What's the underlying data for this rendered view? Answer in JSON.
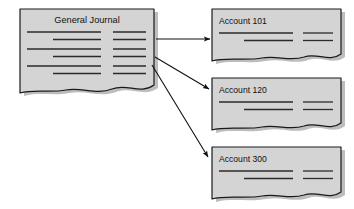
{
  "diagram": {
    "type": "accounting-posting-flow",
    "background_color": "#ffffff",
    "documents": {
      "fill_color": "#d4d4d4",
      "stroke_color": "#1a1a1a",
      "shadow_color": "#bdbdbd",
      "rule_line_color": "#2b2b2b"
    },
    "arrows": {
      "color": "#111111",
      "count": 3
    }
  },
  "source_document": {
    "name": "general-journal",
    "title": "General Journal",
    "rows": 3,
    "right_column_marks": 6
  },
  "target_documents": [
    {
      "name": "account-101",
      "title": "Account 101",
      "rows": 2
    },
    {
      "name": "account-120",
      "title": "Account 120",
      "rows": 2
    },
    {
      "name": "account-300",
      "title": "Account 300",
      "rows": 2
    }
  ],
  "connections": [
    {
      "from": "general-journal",
      "to": "account-101"
    },
    {
      "from": "general-journal",
      "to": "account-120"
    },
    {
      "from": "general-journal",
      "to": "account-300"
    }
  ]
}
